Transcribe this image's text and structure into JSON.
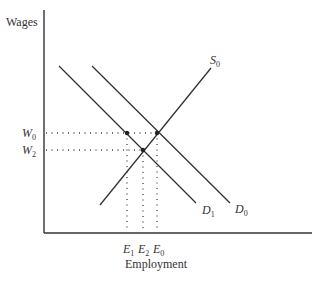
{
  "diagram": {
    "type": "labor-market supply-demand",
    "y_axis_label": "Wages",
    "x_axis_label": "Employment",
    "curves": [
      {
        "id": "S0",
        "name": "S",
        "sub": "0",
        "kind": "supply"
      },
      {
        "id": "D0",
        "name": "D",
        "sub": "0",
        "kind": "demand"
      },
      {
        "id": "D1",
        "name": "D",
        "sub": "1",
        "kind": "demand"
      }
    ],
    "wage_levels": [
      {
        "name": "W",
        "sub": "0"
      },
      {
        "name": "W",
        "sub": "2"
      }
    ],
    "employment_levels": [
      {
        "name": "E",
        "sub": "1"
      },
      {
        "name": "E",
        "sub": "2"
      },
      {
        "name": "E",
        "sub": "0"
      }
    ]
  }
}
